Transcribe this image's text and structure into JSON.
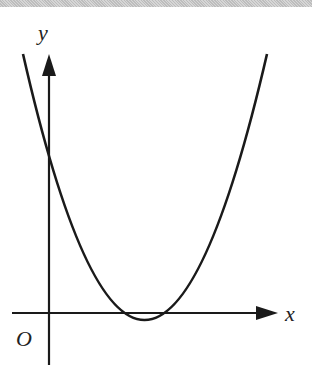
{
  "diagram": {
    "type": "function-graph",
    "axes": {
      "x_label": "x",
      "y_label": "y",
      "origin_label": "O"
    },
    "curve": {
      "kind": "parabola",
      "opens": "up",
      "y_intercept": "positive",
      "vertex": "slightly below x-axis, right of y-axis",
      "x_intercepts": "two positive roots close together"
    },
    "colors": {
      "stroke": "#1a1a1a",
      "background": "#ffffff",
      "top_strip": "#c8c8c8"
    }
  }
}
